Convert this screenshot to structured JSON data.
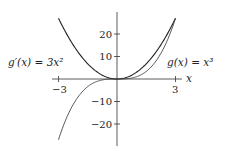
{
  "chart_data": {
    "type": "line",
    "title": "",
    "xlabel": "x",
    "ylabel": "",
    "xlim": [
      -3,
      3
    ],
    "ylim": [
      -27,
      27
    ],
    "x_ticks": [
      "-3",
      "3"
    ],
    "y_ticks": [
      "20",
      "10",
      "-10",
      "-20"
    ],
    "grid": false,
    "series": [
      {
        "name": "g'(x) = 3x^2",
        "function": "3x^2",
        "x": [
          -3,
          -2,
          -1,
          0,
          1,
          2,
          3
        ],
        "values": [
          27,
          12,
          3,
          0,
          3,
          12,
          27
        ]
      },
      {
        "name": "g(x) = x^3",
        "function": "x^3",
        "x": [
          -3,
          -2,
          -1,
          0,
          1,
          2,
          3
        ],
        "values": [
          -27,
          -8,
          -1,
          0,
          1,
          8,
          27
        ]
      }
    ],
    "annotations": [
      "g'(x) = 3x²",
      "g(x) = x³"
    ]
  },
  "labels": {
    "xaxis": "x",
    "xtick_neg": "−3",
    "xtick_pos": "3",
    "ytick_20": "20",
    "ytick_10": "10",
    "ytick_m10": "−10",
    "ytick_m20": "−20",
    "deriv_label": "g′(x) = 3x²",
    "func_label": "g(x) = x³"
  }
}
